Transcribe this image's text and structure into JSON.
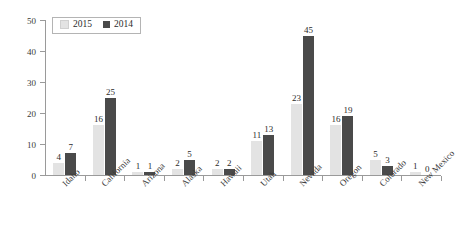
{
  "chart_data": {
    "type": "bar",
    "title": "",
    "subtitle": "",
    "xlabel": "",
    "ylabel": "",
    "ylim": [
      0,
      50
    ],
    "yticks": [
      0,
      10,
      20,
      30,
      40,
      50
    ],
    "grid": false,
    "legend_position": "top-left",
    "categories": [
      "Idaho",
      "California",
      "Arizona",
      "Alaska",
      "Hawaii",
      "Utah",
      "Nevada",
      "Oregon",
      "Colorado",
      "New Mexico"
    ],
    "series": [
      {
        "name": "2015",
        "color": "#e3e3e3",
        "values": [
          4,
          16,
          1,
          2,
          2,
          11,
          23,
          16,
          5,
          1
        ]
      },
      {
        "name": "2014",
        "color": "#4a4a4a",
        "values": [
          7,
          25,
          1,
          5,
          2,
          13,
          45,
          19,
          3,
          0
        ]
      }
    ]
  },
  "axis": {
    "line_color": "#9a9a9a"
  }
}
